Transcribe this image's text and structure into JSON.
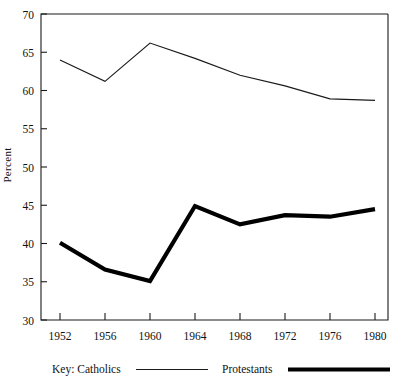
{
  "chart_data": {
    "type": "line",
    "title": "",
    "xlabel": "",
    "ylabel": "Percent",
    "x": [
      1952,
      1956,
      1960,
      1964,
      1968,
      1972,
      1976,
      1980
    ],
    "xtick_labels": [
      "1952",
      "1956",
      "1960",
      "1964",
      "1968",
      "1972",
      "1976",
      "1980"
    ],
    "ytick_labels": [
      "30",
      "35",
      "40",
      "45",
      "50",
      "55",
      "60",
      "65",
      "70"
    ],
    "ytick_values": [
      30,
      35,
      40,
      45,
      50,
      55,
      60,
      65,
      70
    ],
    "ylim": [
      30,
      70
    ],
    "xlim": [
      1952,
      1980
    ],
    "grid": false,
    "legend_position": "below-axes",
    "legend_prefix": "Key:",
    "series": [
      {
        "name": "Catholics",
        "style": "thin-line",
        "color": "#1a1a1a",
        "values": [
          64.0,
          61.2,
          66.2,
          64.2,
          62.0,
          60.6,
          58.9,
          58.7
        ]
      },
      {
        "name": "Protestants",
        "style": "thick-line",
        "color": "#000000",
        "values": [
          40.1,
          36.6,
          35.1,
          44.9,
          42.5,
          43.7,
          43.5,
          44.5
        ]
      }
    ]
  },
  "axes": {
    "y_axis_title": "Percent"
  },
  "legend": {
    "prefix_label": "Key:",
    "entries": [
      {
        "label": "Catholics"
      },
      {
        "label": "Protestants"
      }
    ]
  }
}
